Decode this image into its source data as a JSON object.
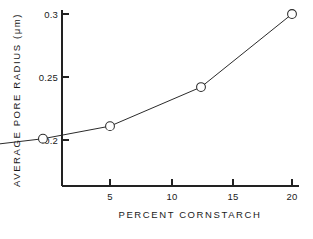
{
  "chart_data": {
    "type": "scatter",
    "title": "",
    "xlabel": "PERCENT CORNSTARCH",
    "ylabel": "AVERAGE PORE RADIUS (μm)",
    "x": [
      0.5,
      1.0,
      1.5,
      2.0,
      3.0,
      5.0,
      10.0,
      20.0
    ],
    "y": [
      0.188,
      0.192,
      0.194,
      0.196,
      0.201,
      0.211,
      0.242,
      0.3
    ],
    "xtick_labels": [
      "5",
      "10",
      "15",
      "20"
    ],
    "xtick_values": [
      5,
      10,
      15,
      20
    ],
    "ytick_labels": [
      "0.3",
      "0.25",
      "0.2"
    ],
    "ytick_values": [
      0.3,
      0.25,
      0.2
    ],
    "xlim": [
      0.35,
      20
    ],
    "ylim": [
      0.168,
      0.3
    ],
    "xscale": "log",
    "yscale": "linear",
    "grid": false,
    "legend": false,
    "marker": "open-circle",
    "line_style": "solid",
    "series": [
      {
        "name": "Average pore radius",
        "points": [
          {
            "x": 0.5,
            "y": 0.188
          },
          {
            "x": 1.0,
            "y": 0.192
          },
          {
            "x": 1.5,
            "y": 0.194
          },
          {
            "x": 2.0,
            "y": 0.196
          },
          {
            "x": 3.0,
            "y": 0.201
          },
          {
            "x": 5.0,
            "y": 0.211
          },
          {
            "x": 10.0,
            "y": 0.242
          },
          {
            "x": 20.0,
            "y": 0.3
          }
        ]
      }
    ]
  },
  "axes": {
    "y_title": "AVERAGE  PORE  RADIUS (μm)",
    "x_title": "PERCENT  CORNSTARCH",
    "y_labels": [
      "0.3",
      "0.25",
      "0.2"
    ],
    "x_labels": [
      "5",
      "10",
      "15",
      "20"
    ]
  },
  "colors": {
    "ink": "#222222",
    "marker_fill": "#ffffff",
    "background": "#ffffff"
  }
}
